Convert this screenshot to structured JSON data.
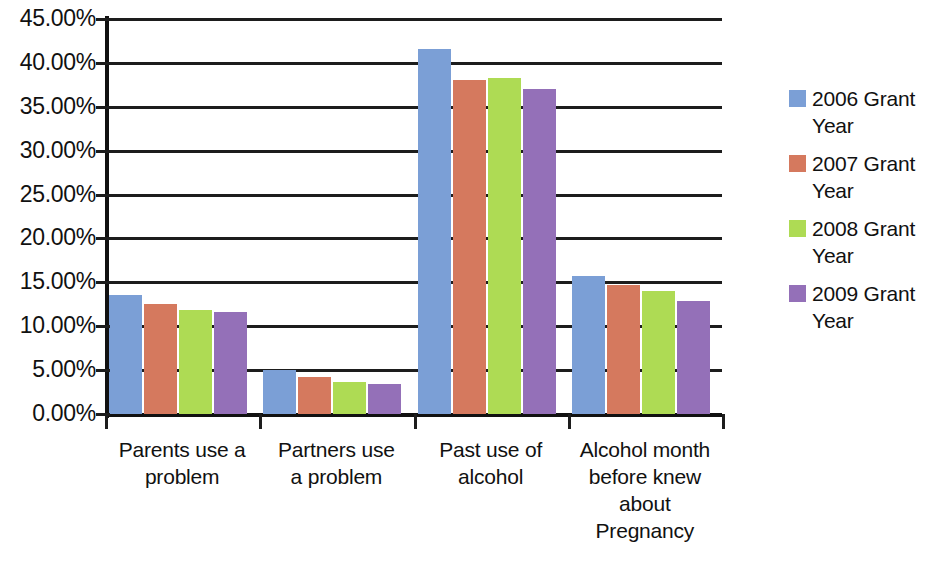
{
  "chart_data": {
    "type": "bar",
    "title": "",
    "xlabel": "",
    "ylabel": "",
    "ylim": [
      0,
      45
    ],
    "ytick_values": [
      0,
      5,
      10,
      15,
      20,
      25,
      30,
      35,
      40,
      45
    ],
    "ytick_labels": [
      "0.00%",
      "5.00%",
      "10.00%",
      "15.00%",
      "20.00%",
      "25.00%",
      "30.00%",
      "35.00%",
      "40.00%",
      "45.00%"
    ],
    "grid": true,
    "legend_position": "right",
    "categories": [
      "Parents use a problem",
      "Partners use a problem",
      "Past use of alcohol",
      "Alcohol month before knew about Pregnancy"
    ],
    "category_lines": [
      [
        "Parents use a",
        "problem"
      ],
      [
        "Partners use",
        "a problem"
      ],
      [
        "Past use of",
        "alcohol"
      ],
      [
        "Alcohol month",
        "before knew",
        "about",
        "Pregnancy"
      ]
    ],
    "series": [
      {
        "name": "2006 Grant Year",
        "color": "#7B9FD6",
        "values": [
          13.6,
          5.0,
          41.6,
          15.7
        ]
      },
      {
        "name": "2007 Grant Year",
        "color": "#D5795E",
        "values": [
          12.5,
          4.2,
          38.1,
          14.7
        ]
      },
      {
        "name": "2008 Grant Year",
        "color": "#AEDB54",
        "values": [
          11.8,
          3.7,
          38.3,
          14.0
        ]
      },
      {
        "name": "2009 Grant Year",
        "color": "#9470B8",
        "values": [
          11.6,
          3.4,
          37.0,
          12.9
        ]
      }
    ]
  },
  "legend": {
    "items": [
      {
        "label": "2006 Grant Year",
        "color": "#7B9FD6"
      },
      {
        "label": "2007 Grant Year",
        "color": "#D5795E"
      },
      {
        "label": "2008 Grant Year",
        "color": "#AEDB54"
      },
      {
        "label": "2009 Grant Year",
        "color": "#9470B8"
      }
    ]
  }
}
